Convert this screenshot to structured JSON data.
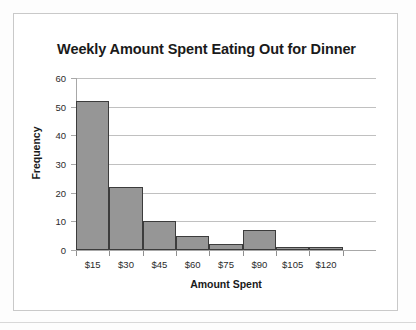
{
  "chart_data": {
    "type": "bar",
    "title": "Weekly Amount Spent Eating Out for Dinner",
    "xlabel": "Amount Spent",
    "ylabel": "Frequency",
    "categories": [
      "$15",
      "$30",
      "$45",
      "$60",
      "$75",
      "$90",
      "$105",
      "$120"
    ],
    "values": [
      52,
      22,
      10,
      5,
      2,
      7,
      1,
      1
    ],
    "ylim": [
      0,
      60
    ],
    "yticks": [
      0,
      10,
      20,
      30,
      40,
      50,
      60
    ],
    "ytick_labels": [
      "0",
      "10",
      "20",
      "30",
      "40",
      "50",
      "60"
    ],
    "grid": true,
    "legend": false,
    "bar_color": "#969696",
    "bar_edge_color": "#3c3c3c",
    "gridline_color": "#c0c0c0",
    "axis_color": "#a8a8a8",
    "plot_background": "#ffffff",
    "histogram_note": "bars are contiguous (histogram), tick labels mark upper class bounds"
  }
}
